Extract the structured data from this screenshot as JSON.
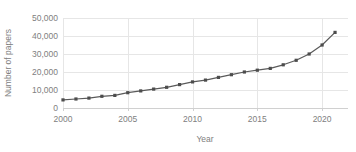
{
  "chart_data": {
    "type": "line",
    "title": "",
    "xlabel": "Year",
    "ylabel": "Number of papers",
    "xlim": [
      2000,
      2022
    ],
    "ylim": [
      0,
      50000
    ],
    "grid": true,
    "legend": false,
    "legend_position": "none",
    "x_tick_labels": [
      "2000",
      "2005",
      "2010",
      "2015",
      "2020"
    ],
    "x_ticks": [
      2000,
      2005,
      2010,
      2015,
      2020
    ],
    "y_tick_labels": [
      "0",
      "10,000",
      "20,000",
      "30,000",
      "40,000",
      "50,000"
    ],
    "y_ticks": [
      0,
      10000,
      20000,
      30000,
      40000,
      50000
    ],
    "marker": "square",
    "line_color": "#5a5a5a",
    "marker_color": "#4d4d4d",
    "grid_color": "#e6e6e6",
    "text_color": "#808080",
    "x": [
      2000,
      2001,
      2002,
      2003,
      2004,
      2005,
      2006,
      2007,
      2008,
      2009,
      2010,
      2011,
      2012,
      2013,
      2014,
      2015,
      2016,
      2017,
      2018,
      2019,
      2020,
      2021
    ],
    "values": [
      4500,
      5000,
      5500,
      6500,
      7000,
      8500,
      9500,
      10500,
      11500,
      13000,
      14500,
      15500,
      17000,
      18500,
      20000,
      21000,
      22000,
      24000,
      26500,
      30000,
      35000,
      42000
    ],
    "series": [
      {
        "name": "Number of papers",
        "values": [
          4500,
          5000,
          5500,
          6500,
          7000,
          8500,
          9500,
          10500,
          11500,
          13000,
          14500,
          15500,
          17000,
          18500,
          20000,
          21000,
          22000,
          24000,
          26500,
          30000,
          35000,
          42000
        ]
      }
    ]
  },
  "axis": {
    "y_title": "Number of papers",
    "x_title": "Year"
  }
}
